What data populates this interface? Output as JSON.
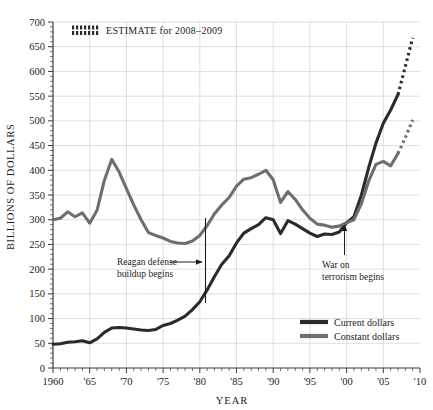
{
  "chart_data": {
    "type": "line",
    "title": "",
    "xlabel": "YEAR",
    "ylabel": "BILLIONS OF DOLLARS",
    "xlim": [
      1960,
      2010
    ],
    "ylim": [
      0,
      700
    ],
    "ytick_step": 50,
    "xtick_step": 5,
    "minor_xtick_step": 1,
    "grid": true,
    "legend_position": "bottom-right",
    "ytick_labels": [
      "0",
      "50",
      "100",
      "150",
      "200",
      "250",
      "300",
      "350",
      "400",
      "450",
      "500",
      "550",
      "600",
      "650",
      "700"
    ],
    "xtick_labels": [
      "1960",
      "'65",
      "'70",
      "'75",
      "'80",
      "'85",
      "'90",
      "'95",
      "'00",
      "'05",
      "'10"
    ],
    "series": [
      {
        "name": "Current dollars",
        "color": "#2b2b2b",
        "x": [
          1960,
          1961,
          1962,
          1963,
          1964,
          1965,
          1966,
          1967,
          1968,
          1969,
          1970,
          1971,
          1972,
          1973,
          1974,
          1975,
          1976,
          1977,
          1978,
          1979,
          1980,
          1981,
          1982,
          1983,
          1984,
          1985,
          1986,
          1987,
          1988,
          1989,
          1990,
          1991,
          1992,
          1993,
          1994,
          1995,
          1996,
          1997,
          1998,
          1999,
          2000,
          2001,
          2002,
          2003,
          2004,
          2005,
          2006,
          2007
        ],
        "values": [
          48,
          49,
          52,
          53,
          55,
          51,
          59,
          72,
          81,
          82,
          81,
          79,
          77,
          76,
          78,
          86,
          90,
          97,
          105,
          118,
          134,
          158,
          185,
          210,
          227,
          253,
          273,
          282,
          290,
          304,
          300,
          272,
          298,
          291,
          282,
          273,
          266,
          271,
          270,
          275,
          294,
          306,
          349,
          405,
          455,
          495,
          522,
          553
        ],
        "estimate_x": [
          2007,
          2008,
          2009
        ],
        "estimate_values": [
          553,
          610,
          668
        ]
      },
      {
        "name": "Constant dollars",
        "color": "#6e6e6e",
        "x": [
          1960,
          1961,
          1962,
          1963,
          1964,
          1965,
          1966,
          1967,
          1968,
          1969,
          1970,
          1971,
          1972,
          1973,
          1974,
          1975,
          1976,
          1977,
          1978,
          1979,
          1980,
          1981,
          1982,
          1983,
          1984,
          1985,
          1986,
          1987,
          1988,
          1989,
          1990,
          1991,
          1992,
          1993,
          1994,
          1995,
          1996,
          1997,
          1998,
          1999,
          2000,
          2001,
          2002,
          2003,
          2004,
          2005,
          2006,
          2007
        ],
        "values": [
          300,
          303,
          316,
          306,
          314,
          293,
          319,
          380,
          422,
          397,
          363,
          330,
          300,
          274,
          268,
          263,
          256,
          253,
          252,
          257,
          268,
          288,
          312,
          330,
          345,
          368,
          382,
          385,
          392,
          400,
          381,
          335,
          357,
          341,
          320,
          303,
          291,
          289,
          285,
          287,
          294,
          300,
          332,
          378,
          412,
          418,
          409,
          434
        ],
        "estimate_x": [
          2007,
          2008,
          2009
        ],
        "estimate_values": [
          434,
          466,
          502
        ]
      }
    ],
    "annotations": [
      {
        "id": "estimate-legend",
        "text": "ESTIMATE for 2008–2009",
        "swatch": "dotted-pattern"
      },
      {
        "id": "reagan-marker",
        "text_line1": "Reagan defense",
        "text_line2": "buildup begins",
        "year": 1981,
        "arrow": "right",
        "marker": "vertical-line"
      },
      {
        "id": "war-terrorism-marker",
        "text_line1": "War on",
        "text_line2": "terrorism begins",
        "year": 2001,
        "arrow": "up",
        "marker": "vertical-line"
      }
    ]
  },
  "colors": {
    "current_dollars": "#2b2b2b",
    "constant_dollars": "#6e6e6e",
    "grid": "#d5d5d5",
    "axis": "#3a3a3a",
    "background": "#ffffff"
  },
  "legend": {
    "items": [
      {
        "label": "Current dollars",
        "color": "#2b2b2b"
      },
      {
        "label": "Constant dollars",
        "color": "#6e6e6e"
      }
    ]
  }
}
